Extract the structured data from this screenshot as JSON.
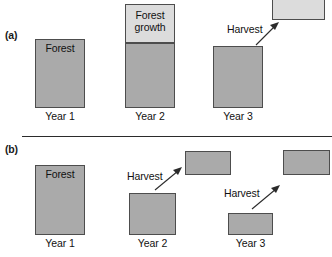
{
  "figure": {
    "width": 332,
    "height": 257,
    "background": "#ffffff",
    "colors": {
      "dark_block": "#aaaaaa",
      "light_block": "#dcdcdc",
      "block_border": "#4d4d4d",
      "text": "#111111",
      "divider": "#2b2b2b"
    }
  },
  "panel_a": {
    "label": "(a)",
    "blocks": {
      "year1_forest": {
        "text": "Forest"
      },
      "year2_growth": {
        "text": "Forest\ngrowth"
      },
      "year2_stock": {
        "text": ""
      },
      "year3_stock": {
        "text": ""
      },
      "year3_harvest": {
        "text": ""
      }
    },
    "annotations": {
      "harvest": "Harvest"
    },
    "x_labels": [
      "Year 1",
      "Year 2",
      "Year 3"
    ]
  },
  "panel_b": {
    "label": "(b)",
    "blocks": {
      "year1_forest": {
        "text": "Forest"
      },
      "year2_stock": {
        "text": ""
      },
      "year2_harvest": {
        "text": ""
      },
      "year3_stock": {
        "text": ""
      },
      "year3_harvest": {
        "text": ""
      }
    },
    "annotations": {
      "harvest_year2": "Harvest",
      "harvest_year3": "Harvest"
    },
    "x_labels": [
      "Year 1",
      "Year 2",
      "Year 3"
    ]
  }
}
